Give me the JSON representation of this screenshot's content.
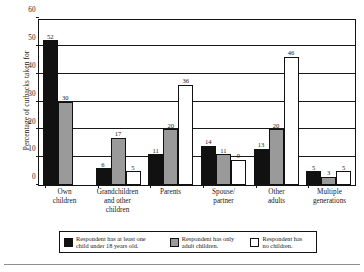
{
  "chart_data": {
    "type": "bar",
    "title": "",
    "xlabel": "",
    "ylabel": "Percentage of cutbacks taken for",
    "ylim": [
      0,
      60
    ],
    "ytick_labels": [
      "0",
      "10",
      "20",
      "30",
      "40",
      "50",
      "60"
    ],
    "ytick_values": [
      0,
      10,
      20,
      30,
      40,
      50,
      60
    ],
    "grid": true,
    "legend_position": "bottom",
    "categories": [
      "Own\nchildren",
      "Grandchildren\nand other\nchildren",
      "Parents",
      "Spouse/\npartner",
      "Other\nadults",
      "Multiple\ngenerations"
    ],
    "series": [
      {
        "name": "Respondent has at least one child under 18 years old.",
        "color": "#111111",
        "values": [
          52,
          6,
          11,
          14,
          13,
          5
        ]
      },
      {
        "name": "Respondent has only adult children.",
        "color": "#9a9a9a",
        "values": [
          30,
          17,
          20,
          11,
          20,
          3
        ]
      },
      {
        "name": "Respondent has no children.",
        "color": "#ffffff",
        "values": [
          null,
          5,
          36,
          9,
          46,
          5
        ]
      }
    ]
  },
  "legend": {
    "items": [
      {
        "swatch": "black-swatch",
        "label": "Respondent has at least one\nchild under 18 years old."
      },
      {
        "swatch": "gray-swatch",
        "label": "Respondent has only\nadult children."
      },
      {
        "swatch": "white-swatch",
        "label": "Respondent has\nno children."
      }
    ]
  }
}
